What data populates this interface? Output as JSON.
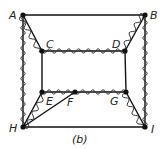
{
  "caption": "(b)",
  "colors": {
    "line": "#111111",
    "wavy": "#333333",
    "background": "#ffffff"
  },
  "nodes": [
    {
      "id": "A",
      "label": "A"
    },
    {
      "id": "B",
      "label": "B"
    },
    {
      "id": "C",
      "label": "C"
    },
    {
      "id": "D",
      "label": "D"
    },
    {
      "id": "E",
      "label": "E"
    },
    {
      "id": "F",
      "label": "F"
    },
    {
      "id": "G",
      "label": "G"
    },
    {
      "id": "H",
      "label": "H"
    },
    {
      "id": "I",
      "label": "I"
    }
  ],
  "edges": [
    {
      "from": "A",
      "to": "B",
      "style": "straight"
    },
    {
      "from": "H",
      "to": "I",
      "style": "straight"
    },
    {
      "from": "A",
      "to": "H",
      "style": "straight+wavy"
    },
    {
      "from": "B",
      "to": "I",
      "style": "straight+wavy"
    },
    {
      "from": "A",
      "to": "C",
      "style": "straight+wavy"
    },
    {
      "from": "B",
      "to": "D",
      "style": "straight+wavy"
    },
    {
      "from": "C",
      "to": "D",
      "style": "straight+wavy"
    },
    {
      "from": "C",
      "to": "E",
      "style": "straight"
    },
    {
      "from": "D",
      "to": "G",
      "style": "straight"
    },
    {
      "from": "E",
      "to": "F",
      "style": "straight+wavy"
    },
    {
      "from": "F",
      "to": "G",
      "style": "straight+wavy"
    },
    {
      "from": "H",
      "to": "E",
      "style": "straight+wavy"
    },
    {
      "from": "H",
      "to": "F",
      "style": "straight"
    },
    {
      "from": "G",
      "to": "I",
      "style": "straight+wavy"
    }
  ]
}
